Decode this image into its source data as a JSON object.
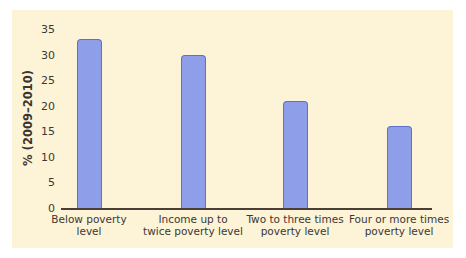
{
  "chart_data": {
    "type": "bar",
    "title": "",
    "xlabel": "",
    "ylabel": "% (2009–2010)",
    "ylim": [
      0,
      35
    ],
    "yticks": [
      0,
      5,
      10,
      15,
      20,
      25,
      30,
      35
    ],
    "categories": [
      "Below poverty level",
      "Income up to twice poverty level",
      "Two to three times poverty level",
      "Four or more times poverty level"
    ],
    "category_lines": [
      [
        "Below poverty",
        "level"
      ],
      [
        "Income up to",
        "twice poverty level"
      ],
      [
        "Two to three times",
        "poverty level"
      ],
      [
        "Four or more times",
        "poverty level"
      ]
    ],
    "values": [
      33,
      30,
      21,
      16
    ],
    "grid": false,
    "legend": null,
    "colors": {
      "bar_fill": "#8f9ee8",
      "bar_border": "#5f70c8",
      "background": "#fdf3d7",
      "axis": "#4a3f35"
    }
  }
}
